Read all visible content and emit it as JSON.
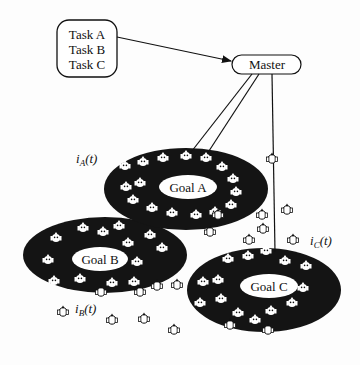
{
  "diagram": {
    "task_box": {
      "lines": [
        "Task A",
        "Task B",
        "Task C"
      ]
    },
    "master": {
      "label": "Master"
    },
    "goals": [
      {
        "id": "A",
        "label": "Goal A",
        "cx": 186,
        "cy": 189,
        "rx": 82,
        "ry": 41
      },
      {
        "id": "B",
        "label": "Goal B",
        "cx": 105,
        "cy": 255,
        "rx": 82,
        "ry": 38
      },
      {
        "id": "C",
        "label": "Goal C",
        "cx": 264,
        "cy": 290,
        "rx": 77,
        "ry": 42
      }
    ],
    "interest_labels": [
      {
        "id": "A",
        "base": "i",
        "sub": "A",
        "arg": "(t)"
      },
      {
        "id": "B",
        "base": "i",
        "sub": "B",
        "arg": "(t)"
      },
      {
        "id": "C",
        "base": "i",
        "sub": "C",
        "arg": "(t)"
      }
    ],
    "edges": [
      {
        "from": "task_box",
        "to": "master",
        "arrow": true
      },
      {
        "from": "master",
        "to": "goal_A",
        "arrow": false
      },
      {
        "from": "master",
        "to": "goal_A",
        "arrow": false
      },
      {
        "from": "master",
        "to": "goal_C",
        "arrow": false
      }
    ],
    "colors": {
      "ellipse_fill": "#141414",
      "robot_fill": "#ffffff",
      "stroke": "#111111",
      "background": "#fdfdfd"
    }
  }
}
